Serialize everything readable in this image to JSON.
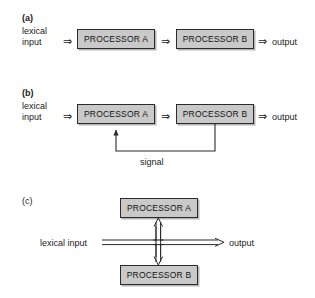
{
  "figure": {
    "background": "#ffffff",
    "box_fill": "#c9c9c9",
    "box_stroke": "#2b2b2b",
    "text_color": "#1a1a1a"
  },
  "panels": [
    {
      "id": "a",
      "letter": "(a)",
      "input_line1": "lexical",
      "input_line2": "input",
      "arrow1": "⇒",
      "box1": "PROCESSOR A",
      "arrow2": "⇒",
      "box2": "PROCESSOR B",
      "arrow3": "⇒",
      "output": "output"
    },
    {
      "id": "b",
      "letter": "(b)",
      "input_line1": "lexical",
      "input_line2": "input",
      "arrow1": "⇒",
      "box1": "PROCESSOR A",
      "arrow2": "⇒",
      "box2": "PROCESSOR B",
      "arrow3": "⇒",
      "output": "output",
      "feedback_label": "signal"
    },
    {
      "id": "c",
      "letter": "(c)",
      "box_top": "PROCESSOR A",
      "box_bottom": "PROCESSOR B",
      "input": "lexical input",
      "output": "output"
    }
  ]
}
